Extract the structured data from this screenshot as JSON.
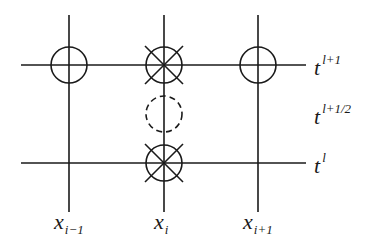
{
  "diagram": {
    "colors": {
      "line": "#1a1a1a",
      "background": "#ffffff"
    },
    "columns": [
      {
        "id": "x_im1",
        "x": 69,
        "label_base": "x",
        "label_sub": "i−1"
      },
      {
        "id": "x_i",
        "x": 164,
        "label_base": "x",
        "label_sub": "i"
      },
      {
        "id": "x_ip1",
        "x": 258,
        "label_base": "x",
        "label_sub": "i+1"
      }
    ],
    "rows": [
      {
        "id": "t_lp1",
        "y": 65,
        "label_base": "t",
        "label_sup": "l+1",
        "has_line": true
      },
      {
        "id": "t_lhalf",
        "y": 113,
        "label_base": "t",
        "label_sup": "l+1/2",
        "has_line": false
      },
      {
        "id": "t_l",
        "y": 163,
        "label_base": "t",
        "label_sup": "l",
        "has_line": true
      }
    ],
    "nodes": [
      {
        "col": "x_im1",
        "row": "t_lp1",
        "marker": "circle"
      },
      {
        "col": "x_i",
        "row": "t_lp1",
        "marker": "circle-cross"
      },
      {
        "col": "x_ip1",
        "row": "t_lp1",
        "marker": "circle"
      },
      {
        "col": "x_i",
        "row": "t_lhalf",
        "marker": "dashed-circle"
      },
      {
        "col": "x_i",
        "row": "t_l",
        "marker": "circle-cross"
      }
    ]
  }
}
